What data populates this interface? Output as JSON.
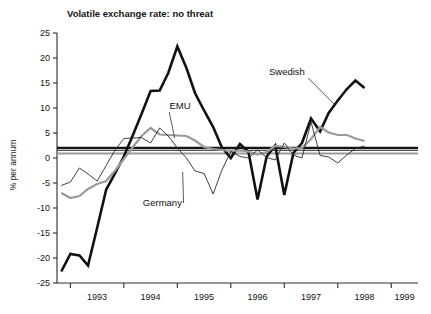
{
  "chart_data": {
    "type": "line",
    "title": "Volatile exchange rate: no threat",
    "xlabel": "",
    "ylabel": "% per annum",
    "ylim": [
      -25,
      25
    ],
    "xlim": [
      1992.75,
      1999.5
    ],
    "yticks": [
      25,
      20,
      15,
      10,
      5,
      0,
      -5,
      -10,
      -15,
      -20,
      -25
    ],
    "ytick_labels": [
      "25",
      "20",
      "15",
      "10",
      "5",
      "0",
      "-5",
      "-10",
      "-15",
      "-20",
      "-25"
    ],
    "xticks": [
      1993,
      1994,
      1995,
      1996,
      1997,
      1998,
      1999
    ],
    "xtick_labels": [
      "1993",
      "1994",
      "1995",
      "1996",
      "1997",
      "1998",
      "1999"
    ],
    "grid": false,
    "legend_position": "inline-annotations",
    "annotations": [
      {
        "text": "Swedish",
        "x": 1997.05,
        "y": 16.6,
        "leader_to_x": 1997.95,
        "leader_to_y": 10.6
      },
      {
        "text": "EMU",
        "x": 1995.05,
        "y": 9.8,
        "leader_to_x": 1994.95,
        "leader_to_y": 4.0
      },
      {
        "text": "Germany",
        "x": 1994.72,
        "y": -9.6,
        "leader_to_x": 1995.1,
        "leader_to_y": -2.8
      }
    ],
    "reference_lines": [
      {
        "name": "swedish-target-band",
        "y": 2.0,
        "color": "#141414",
        "width": 2.6
      },
      {
        "name": "emu-reference-band",
        "y": 0.9,
        "color": "#9a9a9a",
        "width": 2.2
      },
      {
        "name": "germany-reference-band",
        "y": 1.5,
        "color": "#3d3d3d",
        "width": 0.9
      }
    ],
    "series": [
      {
        "name": "Swedish",
        "color": "#111111",
        "width": 2.6,
        "x": [
          1992.83,
          1993.0,
          1993.17,
          1993.33,
          1993.5,
          1993.67,
          1993.83,
          1994.0,
          1994.17,
          1994.33,
          1994.5,
          1994.67,
          1994.83,
          1995.0,
          1995.17,
          1995.33,
          1995.5,
          1995.67,
          1995.83,
          1996.0,
          1996.17,
          1996.33,
          1996.5,
          1996.67,
          1996.83,
          1997.0,
          1997.17,
          1997.33,
          1997.5,
          1997.67,
          1997.83,
          1998.0,
          1998.17,
          1998.33,
          1998.5
        ],
        "values": [
          -22.7,
          -19.2,
          -19.5,
          -21.5,
          -14.0,
          -6.3,
          -3.2,
          0.3,
          4.6,
          8.8,
          13.4,
          13.5,
          17.0,
          22.3,
          18.0,
          13.0,
          9.5,
          6.2,
          2.2,
          0.0,
          2.8,
          1.2,
          -8.3,
          0.3,
          2.5,
          -7.4,
          1.0,
          3.0,
          7.9,
          5.3,
          9.0,
          11.5,
          13.8,
          15.5,
          14.0
        ]
      },
      {
        "name": "EMU",
        "color": "#9a9a9a",
        "width": 2.2,
        "x": [
          1992.83,
          1993.0,
          1993.17,
          1993.33,
          1993.5,
          1993.67,
          1993.83,
          1994.0,
          1994.17,
          1994.33,
          1994.5,
          1994.67,
          1994.83,
          1995.0,
          1995.17,
          1995.33,
          1995.5,
          1995.67,
          1995.83,
          1996.0,
          1996.17,
          1996.33,
          1996.5,
          1996.67,
          1996.83,
          1997.0,
          1997.17,
          1997.33,
          1997.5,
          1997.67,
          1997.83,
          1998.0,
          1998.17,
          1998.33,
          1998.5
        ],
        "values": [
          -7.0,
          -8.0,
          -7.6,
          -6.2,
          -5.2,
          -4.6,
          -2.6,
          -0.2,
          2.2,
          4.4,
          6.0,
          4.7,
          4.6,
          4.5,
          4.4,
          3.5,
          2.2,
          1.8,
          1.6,
          1.4,
          1.5,
          1.3,
          0.7,
          1.2,
          2.4,
          2.2,
          1.9,
          2.0,
          3.8,
          6.2,
          5.1,
          4.6,
          4.6,
          3.9,
          3.4
        ]
      },
      {
        "name": "Germany",
        "color": "#2b2b2b",
        "width": 0.9,
        "x": [
          1992.83,
          1993.0,
          1993.17,
          1993.33,
          1993.5,
          1993.67,
          1993.83,
          1994.0,
          1994.17,
          1994.33,
          1994.5,
          1994.67,
          1994.83,
          1995.0,
          1995.17,
          1995.33,
          1995.5,
          1995.67,
          1995.83,
          1996.0,
          1996.17,
          1996.33,
          1996.5,
          1996.67,
          1996.83,
          1997.0,
          1997.17,
          1997.33,
          1997.5,
          1997.67,
          1997.83,
          1998.0,
          1998.17,
          1998.33,
          1998.5
        ],
        "values": [
          -5.5,
          -4.8,
          -2.0,
          -3.2,
          -4.6,
          -1.5,
          1.5,
          3.9,
          4.0,
          4.1,
          3.0,
          6.0,
          4.4,
          2.0,
          0.0,
          -2.6,
          -3.1,
          -7.2,
          -2.5,
          1.3,
          0.3,
          0.0,
          1.6,
          0.1,
          -0.4,
          3.0,
          0.6,
          0.0,
          7.2,
          0.5,
          0.2,
          -1.0,
          0.6,
          1.9,
          2.4
        ]
      }
    ]
  },
  "plot": {
    "left": 57,
    "right": 418,
    "top": 33,
    "bottom": 283
  }
}
